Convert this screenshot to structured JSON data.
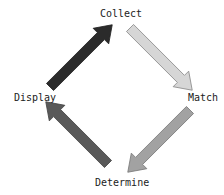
{
  "diagram": {
    "type": "cycle",
    "nodes": [
      {
        "id": "collect",
        "label": "Collect"
      },
      {
        "id": "match",
        "label": "Match"
      },
      {
        "id": "determine",
        "label": "Determine"
      },
      {
        "id": "display",
        "label": "Display"
      }
    ],
    "edges": [
      {
        "from": "collect",
        "to": "match",
        "color": "#d6d6d6"
      },
      {
        "from": "match",
        "to": "determine",
        "color": "#a2a2a2"
      },
      {
        "from": "determine",
        "to": "display",
        "color": "#595959"
      },
      {
        "from": "display",
        "to": "collect",
        "color": "#2b2b2b"
      }
    ]
  }
}
